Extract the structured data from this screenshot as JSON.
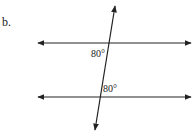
{
  "problem": {
    "label": "b.",
    "angles": [
      {
        "position": "below-left of upper intersection",
        "text": "80°"
      },
      {
        "position": "above-right of lower intersection",
        "text": "80°"
      }
    ],
    "lines": [
      "upper horizontal line",
      "lower horizontal line",
      "transversal"
    ]
  },
  "colors": {
    "line": "#222222",
    "background": "#ffffff"
  }
}
